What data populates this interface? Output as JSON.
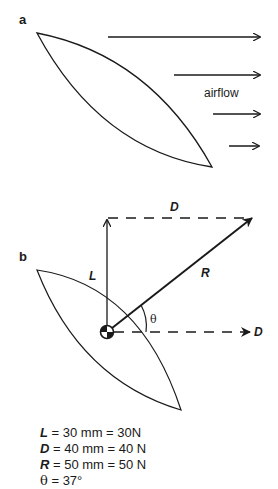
{
  "panel_a": {
    "label": "a",
    "airflow_label": "airflow"
  },
  "panel_b": {
    "label": "b",
    "lift_label": "L",
    "drag_label_top": "D",
    "drag_label_right": "D",
    "resultant_label": "R",
    "angle_label": "θ"
  },
  "legend": [
    {
      "symbol": "L",
      "text": " = 30 mm = 30N"
    },
    {
      "symbol": "D",
      "text": " = 40 mm = 40 N"
    },
    {
      "symbol": "R",
      "text": " = 50 mm = 50 N"
    },
    {
      "symbol": "θ",
      "text": " = 37°"
    }
  ],
  "colors": {
    "stroke": "#1a1a1a",
    "background": "#ffffff"
  }
}
